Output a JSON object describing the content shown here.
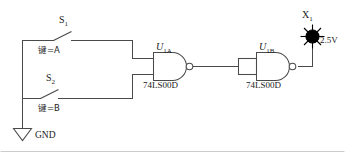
{
  "diagram": {
    "stroke_color": "#4a4a4a",
    "text_color": "#1a1a1a",
    "lamp_color": "#000000",
    "background": "#ffffff"
  },
  "switches": [
    {
      "id": "s1",
      "ref": "S",
      "ref_sub": "1",
      "key_label": "键=A"
    },
    {
      "id": "s2",
      "ref": "S",
      "ref_sub": "2",
      "key_label": "键=B"
    }
  ],
  "gates": [
    {
      "id": "u1a",
      "ref": "U",
      "ref_sub": "1A",
      "part": "74LS00D",
      "type": "nand"
    },
    {
      "id": "u1b",
      "ref": "U",
      "ref_sub": "1B",
      "part": "74LS00D",
      "type": "nand"
    }
  ],
  "ground": {
    "label": "GND"
  },
  "lamp": {
    "ref": "X",
    "ref_sub": "1",
    "voltage": "2.5V"
  }
}
